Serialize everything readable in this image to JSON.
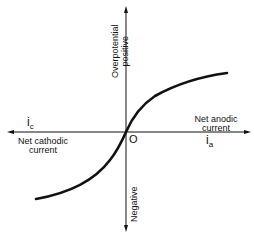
{
  "diagram": {
    "type": "polarization-curve",
    "vertical_axis": {
      "positive_label_line1": "Overpotential",
      "positive_label_line2": "positive",
      "negative_label": "Negative"
    },
    "horizontal_axis": {
      "cathodic_symbol": "i",
      "cathodic_subscript": "c",
      "cathodic_label_line1": "Net cathodic",
      "cathodic_label_line2": "current",
      "anodic_symbol": "i",
      "anodic_subscript": "a",
      "anodic_label_line1": "Net anodic",
      "anodic_label_line2": "current"
    },
    "origin_label": "O",
    "colors": {
      "line": "#111111",
      "background": "#ffffff"
    }
  }
}
